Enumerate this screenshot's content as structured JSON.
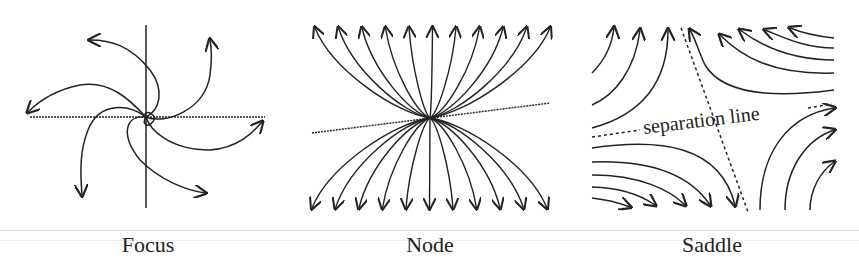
{
  "figure": {
    "panels": [
      {
        "id": "focus",
        "caption": "Focus",
        "type": "spiral focus with 6 trajectories, orthogonal axes"
      },
      {
        "id": "node",
        "caption": "Node",
        "type": "node with 11 top + 11 bottom trajectories converging, dotted tangent line"
      },
      {
        "id": "saddle",
        "caption": "Saddle",
        "type": "saddle with hyperbolic trajectories and two dotted separatrices",
        "annotation": "separation line"
      }
    ]
  },
  "colors": {
    "stroke": "#222222",
    "background": "#ffffff",
    "rule": "#dddddd"
  }
}
